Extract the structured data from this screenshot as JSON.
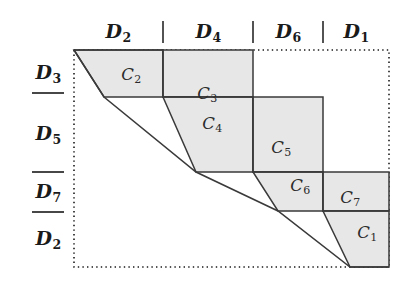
{
  "figure": {
    "type": "staircase-block-diagram",
    "colors": {
      "cell_fill": "#e7e7e7",
      "cell_stroke": "#3a3a3a",
      "box_border": "#1a1a1a",
      "text": "#1a1a1a"
    },
    "bounding_box": {
      "x": 74,
      "y": 50,
      "width": 315,
      "height": 217,
      "style": "dotted"
    }
  },
  "column_headers": {
    "separators_x": [
      163,
      253,
      323
    ],
    "items": [
      {
        "base": "D",
        "sub": "2",
        "x": 118,
        "y": 31
      },
      {
        "base": "D",
        "sub": "4",
        "x": 208,
        "y": 31
      },
      {
        "base": "D",
        "sub": "6",
        "x": 288,
        "y": 31
      },
      {
        "base": "D",
        "sub": "1",
        "x": 356,
        "y": 31
      }
    ]
  },
  "row_headers": {
    "separators": [
      {
        "x1": 32,
        "x2": 64,
        "y": 93
      },
      {
        "x1": 32,
        "x2": 64,
        "y": 172
      },
      {
        "x1": 32,
        "x2": 64,
        "y": 212
      }
    ],
    "items": [
      {
        "base": "D",
        "sub": "3",
        "x": 48,
        "y": 72
      },
      {
        "base": "D",
        "sub": "5",
        "x": 48,
        "y": 133
      },
      {
        "base": "D",
        "sub": "7",
        "x": 48,
        "y": 191
      },
      {
        "base": "D",
        "sub": "2",
        "x": 48,
        "y": 238
      }
    ]
  },
  "cells": [
    {
      "id": "cell-c2",
      "base": "C",
      "sub": "2",
      "label_x": 131,
      "label_y": 75,
      "points": "74,50 163,50 163,97 104,97"
    },
    {
      "id": "cell-c3",
      "base": "C",
      "sub": "3",
      "label_x": 207,
      "label_y": 94,
      "points": "163,50 253,50 253,97 163,97"
    },
    {
      "id": "cell-c4",
      "base": "C",
      "sub": "4",
      "label_x": 212,
      "label_y": 124,
      "points": "163,97 253,97 253,172 196,172"
    },
    {
      "id": "cell-c5",
      "base": "C",
      "sub": "5",
      "label_x": 281,
      "label_y": 148,
      "points": "253,97 323,97 323,172 253,172"
    },
    {
      "id": "cell-c6",
      "base": "C",
      "sub": "6",
      "label_x": 300,
      "label_y": 186,
      "points": "253,172 323,172 323,211 278,211"
    },
    {
      "id": "cell-c7",
      "base": "C",
      "sub": "7",
      "label_x": 350,
      "label_y": 198,
      "points": "323,172 389,172 389,211 323,211"
    },
    {
      "id": "cell-c1",
      "base": "C",
      "sub": "1",
      "label_x": 367,
      "label_y": 233,
      "points": "323,211 389,211 389,267 350,267"
    }
  ],
  "staircase_outline": {
    "upper_path": "74,50 163,50 163,97 253,97 253,172 323,172 323,211 389,211",
    "lower_path": "74,50 104,97 196,172 278,211 350,267 389,267"
  }
}
